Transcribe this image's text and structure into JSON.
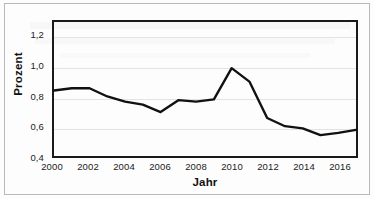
{
  "chart_data": {
    "type": "line",
    "title": "",
    "xlabel": "Jahr",
    "ylabel": "Prozent",
    "x": [
      2000,
      2001,
      2002,
      2003,
      2004,
      2005,
      2006,
      2007,
      2008,
      2009,
      2010,
      2011,
      2012,
      2013,
      2014,
      2015,
      2016,
      2017
    ],
    "values": [
      0.84,
      0.855,
      0.855,
      0.8,
      0.765,
      0.745,
      0.695,
      0.775,
      0.765,
      0.78,
      0.99,
      0.9,
      0.655,
      0.6,
      0.585,
      0.54,
      0.555,
      0.575
    ],
    "series": [
      {
        "name": "Prozent",
        "values": [
          0.84,
          0.855,
          0.855,
          0.8,
          0.765,
          0.745,
          0.695,
          0.775,
          0.765,
          0.78,
          0.99,
          0.9,
          0.655,
          0.6,
          0.585,
          0.54,
          0.555,
          0.575
        ]
      }
    ],
    "xlim": [
      2000,
      2017
    ],
    "ylim": [
      0.4,
      1.3
    ],
    "y_ticks": [
      0.4,
      0.6,
      0.8,
      1.0,
      1.2
    ],
    "y_tick_labels": [
      "0,4",
      "0,6",
      "0,8",
      "1,0",
      "1,2"
    ],
    "x_ticks": [
      2000,
      2002,
      2004,
      2006,
      2008,
      2010,
      2012,
      2014,
      2016
    ],
    "x_tick_labels": [
      "2000",
      "2002",
      "2004",
      "2006",
      "2008",
      "2010",
      "2012",
      "2014",
      "2016"
    ],
    "grid": "horizontal",
    "legend": "none",
    "line_color": "#111111",
    "line_width": 2.4
  },
  "axes": {
    "y_title": "Prozent",
    "x_title": "Jahr"
  }
}
